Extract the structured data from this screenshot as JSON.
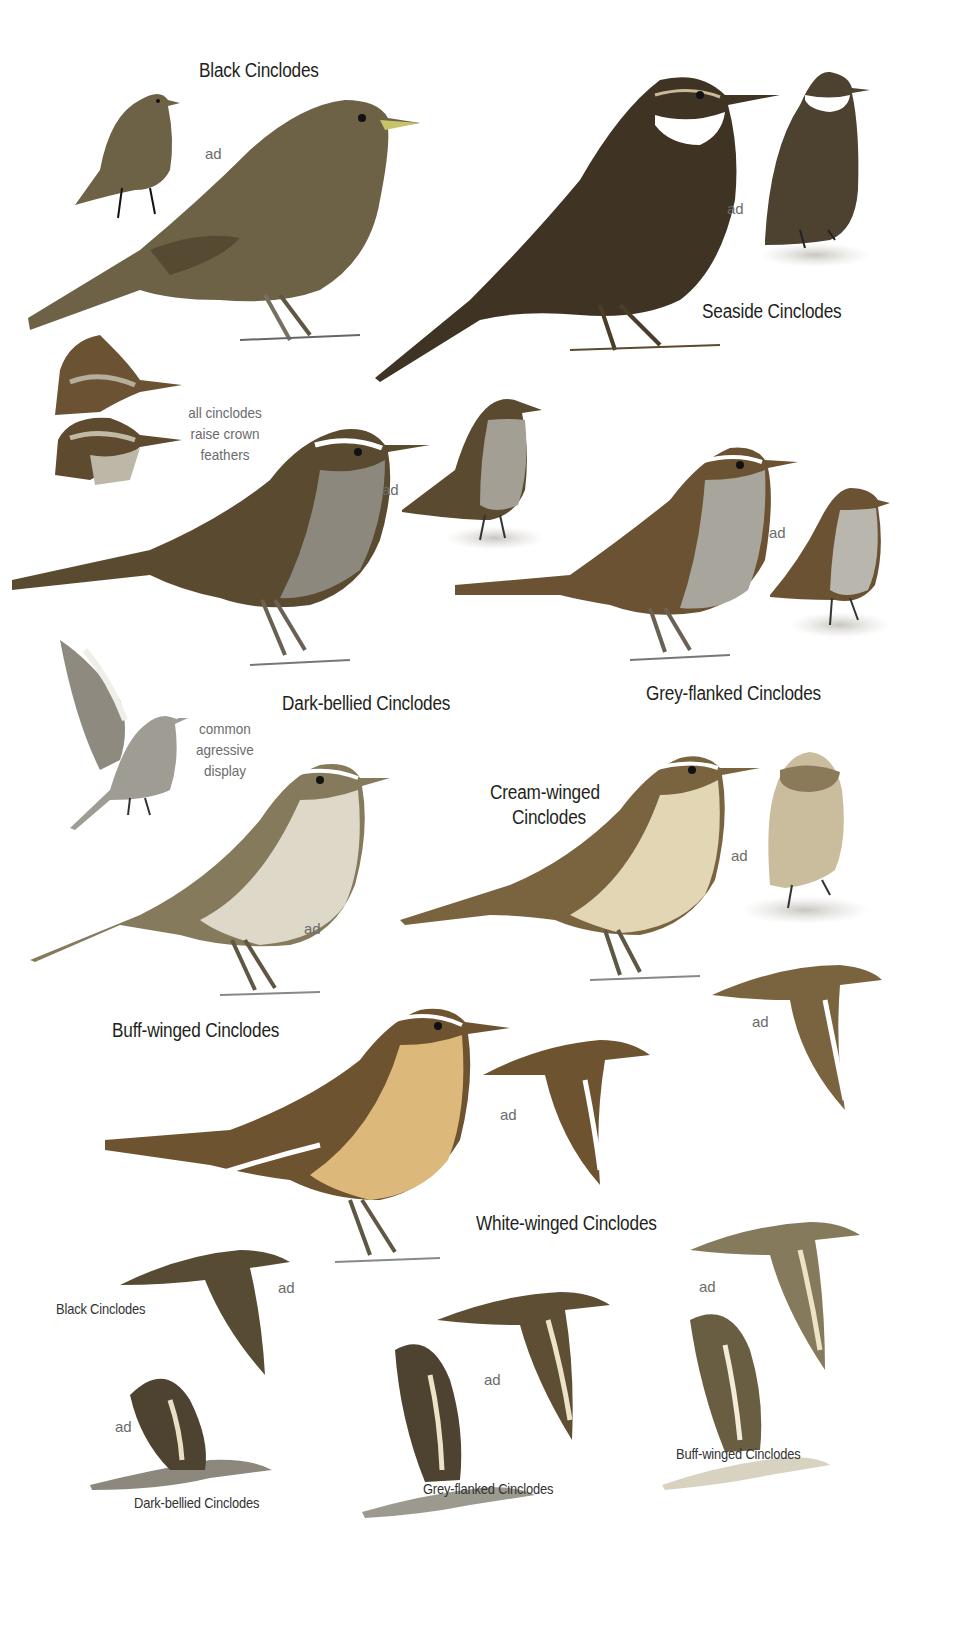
{
  "plate": {
    "background": "#ffffff",
    "species_labels": {
      "black": "Black Cinclodes",
      "seaside": "Seaside Cinclodes",
      "dark_bellied": "Dark-bellied Cinclodes",
      "grey_flanked": "Grey-flanked Cinclodes",
      "cream_winged_line1": "Cream-winged",
      "cream_winged_line2": "Cinclodes",
      "buff_winged": "Buff-winged Cinclodes",
      "white_winged": "White-winged Cinclodes"
    },
    "flight_labels": {
      "black": "Black Cinclodes",
      "dark_bellied": "Dark-bellied Cinclodes",
      "grey_flanked": "Grey-flanked Cinclodes",
      "buff_winged": "Buff-winged Cinclodes"
    },
    "age_label": "ad",
    "notes": {
      "crown": [
        "all cinclodes",
        "raise crown",
        "feathers"
      ],
      "display": [
        "common",
        "agressive",
        "display"
      ]
    },
    "colors": {
      "black_cinclodes": "#6e6246",
      "seaside_cinclodes": "#3f3323",
      "dark_bellied_back": "#5a4a30",
      "dark_bellied_belly": "#8c887d",
      "grey_flanked_back": "#6a5232",
      "grey_flanked_belly": "#a8a59c",
      "buff_winged_back": "#857a5c",
      "buff_winged_belly": "#ddd8c8",
      "cream_winged_back": "#7a6440",
      "cream_winged_belly": "#e3d6b4",
      "white_winged_back": "#6d5330",
      "white_winged_belly": "#dcb87a",
      "label_text": "#231f20",
      "note_text": "#6b6b6b"
    }
  }
}
